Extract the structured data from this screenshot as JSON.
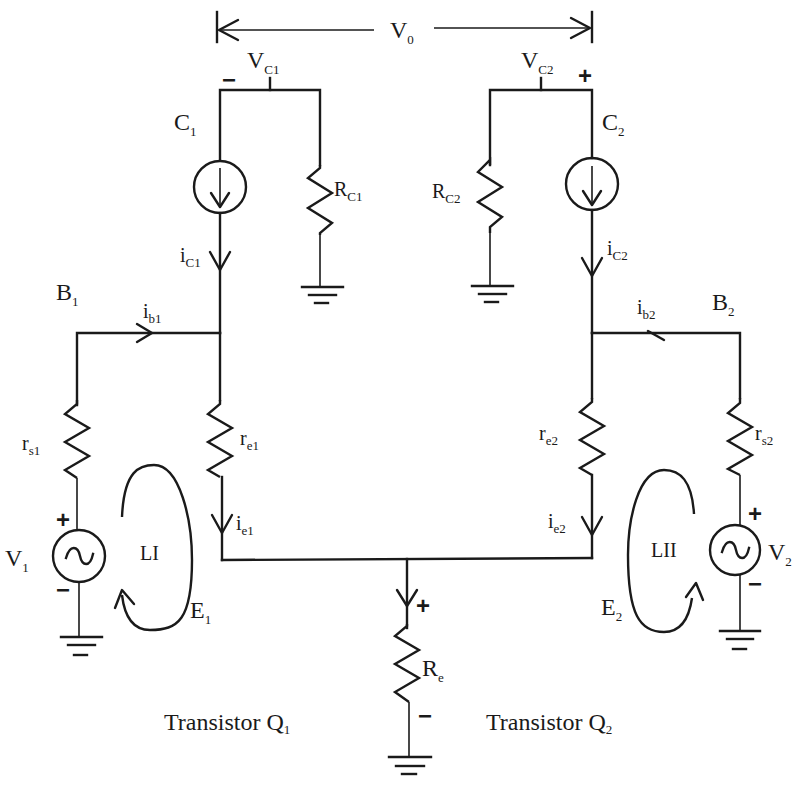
{
  "figure": {
    "output_voltage": {
      "main": "V",
      "sub": "0"
    },
    "collector_nodes": [
      {
        "id": "VC1",
        "main": "V",
        "sub": "C1",
        "polarity": "−"
      },
      {
        "id": "VC2",
        "main": "V",
        "sub": "C2",
        "polarity": "+"
      }
    ],
    "collectors": [
      {
        "main": "C",
        "sub": "1"
      },
      {
        "main": "C",
        "sub": "2"
      }
    ],
    "collector_resistors": [
      {
        "main": "R",
        "sub": "C1"
      },
      {
        "main": "R",
        "sub": "C2"
      }
    ],
    "collector_currents": [
      {
        "main": "i",
        "sub": "C1"
      },
      {
        "main": "i",
        "sub": "C2"
      }
    ],
    "bases": [
      {
        "main": "B",
        "sub": "1"
      },
      {
        "main": "B",
        "sub": "2"
      }
    ],
    "base_currents": [
      {
        "main": "i",
        "sub": "b1"
      },
      {
        "main": "i",
        "sub": "b2"
      }
    ],
    "source_resistors": [
      {
        "main": "r",
        "sub": "s1"
      },
      {
        "main": "r",
        "sub": "s2"
      }
    ],
    "emitter_resistors": [
      {
        "main": "r",
        "sub": "e1"
      },
      {
        "main": "r",
        "sub": "e2"
      }
    ],
    "emitter_currents": [
      {
        "main": "i",
        "sub": "e1"
      },
      {
        "main": "i",
        "sub": "e2"
      }
    ],
    "sources": [
      {
        "main": "V",
        "sub": "1",
        "plus": "+",
        "minus": "−"
      },
      {
        "main": "V",
        "sub": "2",
        "plus": "+",
        "minus": "−"
      }
    ],
    "loops": [
      {
        "label": "LI",
        "emf": {
          "main": "E",
          "sub": "1"
        }
      },
      {
        "label": "LII",
        "emf": {
          "main": "E",
          "sub": "2"
        }
      }
    ],
    "common_emitter_resistor": {
      "main": "R",
      "sub": "e",
      "plus": "+",
      "minus": "−"
    },
    "transistors": [
      {
        "prefix": "Transistor Q",
        "sub": "1"
      },
      {
        "prefix": "Transistor Q",
        "sub": "2"
      }
    ]
  }
}
